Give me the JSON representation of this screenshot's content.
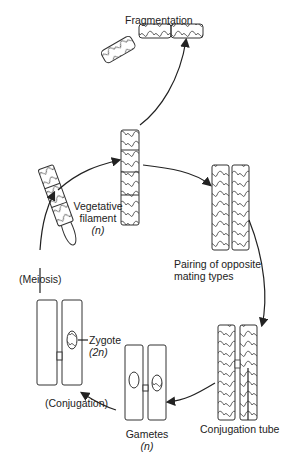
{
  "labels": {
    "fragmentation": "Fragmentation",
    "vegetative_line1": "Vegetative",
    "vegetative_line2": "filament",
    "vegetative_ploidy": "(n)",
    "pairing_line1": "Pairing of opposite",
    "pairing_line2": "mating types",
    "conjugation_tube": "Conjugation tube",
    "gametes": "Gametes",
    "gametes_ploidy": "(n)",
    "conjugation": "(Conjugation)",
    "zygote": "Zygote",
    "zygote_ploidy": "(2n)",
    "meiosis": "(Meiosis)"
  },
  "colors": {
    "line": "#222222",
    "background": "#ffffff"
  }
}
